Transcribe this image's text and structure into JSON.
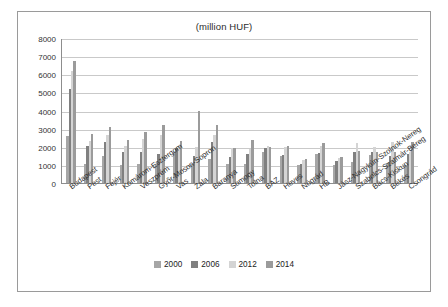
{
  "chart_data": {
    "type": "bar",
    "title": "(million HUF)",
    "xlabel": "",
    "ylabel": "",
    "ylim": [
      0,
      8000
    ],
    "yticks": [
      0,
      1000,
      2000,
      3000,
      4000,
      5000,
      6000,
      7000,
      8000
    ],
    "grid": true,
    "legend_position": "bottom",
    "categories": [
      "Budapest",
      "Pest",
      "Fejér",
      "Komárom-Esztergom",
      "Veszprém",
      "Győr-Moson-Sopron",
      "Vas",
      "Zala",
      "Baranya",
      "Somogy",
      "Tolna",
      "BAZ",
      "Heves",
      "Nógrád",
      "HB",
      "Jász-Nagykún-Szolnok-Nereg",
      "Szabolcs-Szatmár-Bereg",
      "Bács-Kiskun",
      "Békés",
      "Csongrád"
    ],
    "series": [
      {
        "name": "2000",
        "color": "#a6a6a6",
        "values": [
          2600,
          1050,
          1500,
          1000,
          1050,
          1050,
          1700,
          1050,
          1350,
          1050,
          1050,
          1700,
          1500,
          1000,
          1600,
          1000,
          1150,
          1550,
          1100,
          1000
        ]
      },
      {
        "name": "2006",
        "color": "#808080",
        "values": [
          5200,
          2050,
          2300,
          1700,
          1700,
          1600,
          1950,
          1500,
          2300,
          1450,
          1600,
          1950,
          1550,
          1050,
          1650,
          1200,
          1700,
          1700,
          1500,
          1600
        ]
      },
      {
        "name": "2012",
        "color": "#d4d4d4",
        "values": [
          6200,
          2350,
          2650,
          2050,
          2450,
          2650,
          2050,
          2000,
          2650,
          1950,
          1900,
          2050,
          2000,
          1300,
          2050,
          1400,
          2250,
          2000,
          2300,
          1700
        ]
      },
      {
        "name": "2014",
        "color": "#9b9b9b",
        "values": [
          6800,
          2750,
          3100,
          2400,
          2850,
          3250,
          2350,
          4000,
          3200,
          1950,
          2400,
          2000,
          2050,
          1350,
          2200,
          1450,
          1800,
          1700,
          1750,
          2300
        ]
      }
    ]
  },
  "legend": {
    "items": [
      {
        "label": "2000",
        "color": "#a6a6a6"
      },
      {
        "label": "2006",
        "color": "#808080"
      },
      {
        "label": "2012",
        "color": "#d4d4d4"
      },
      {
        "label": "2014",
        "color": "#9b9b9b"
      }
    ]
  },
  "colors": {
    "frame_border": "#9a9a9a",
    "gridline": "#c9c9c9",
    "axis": "#8d8d8d",
    "text": "#2b2b2b",
    "background": "#ffffff"
  }
}
